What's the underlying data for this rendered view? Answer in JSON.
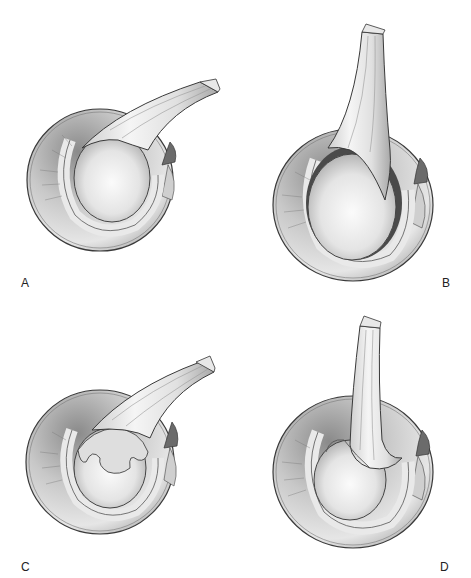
{
  "figure": {
    "panels": [
      {
        "id": "A",
        "label": "A"
      },
      {
        "id": "B",
        "label": "B"
      },
      {
        "id": "C",
        "label": "C"
      },
      {
        "id": "D",
        "label": "D"
      }
    ]
  },
  "colors": {
    "background": "#ffffff",
    "outline": "#3a3a3a",
    "shadow_dark": "#5a5a5a",
    "shadow_mid": "#9a9a9a",
    "highlight": "#f2f2f2",
    "label": "#222222"
  }
}
